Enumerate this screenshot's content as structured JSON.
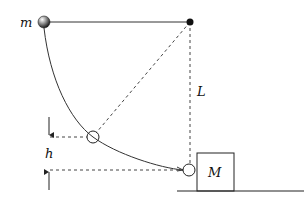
{
  "diagram": {
    "type": "pendulum-collision",
    "labels": {
      "ball_mass": "m",
      "string_length": "L",
      "height": "h",
      "block_mass": "M"
    },
    "colors": {
      "line": "#222222",
      "dashed": "#444444",
      "background": "#ffffff"
    }
  }
}
